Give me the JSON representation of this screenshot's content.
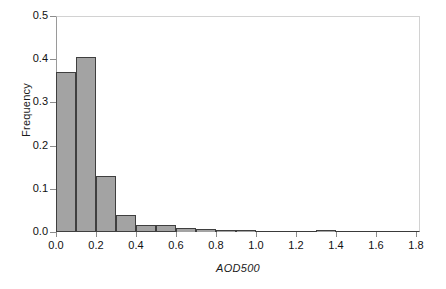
{
  "chart_data": {
    "type": "bar",
    "title": "",
    "subtitle": "",
    "xlabel": "AOD500",
    "ylabel": "Frequency",
    "xlim": [
      0.0,
      1.82
    ],
    "ylim": [
      0.0,
      0.5
    ],
    "grid": false,
    "legend": null,
    "bin_width": 0.1,
    "x_ticks": [
      "0.0",
      "0.2",
      "0.4",
      "0.6",
      "0.8",
      "1.0",
      "1.2",
      "1.4",
      "1.6",
      "1.8"
    ],
    "x_tick_values": [
      0.0,
      0.2,
      0.4,
      0.6,
      0.8,
      1.0,
      1.2,
      1.4,
      1.6,
      1.8
    ],
    "y_ticks": [
      "0.0",
      "0.1",
      "0.2",
      "0.3",
      "0.4",
      "0.5"
    ],
    "y_tick_values": [
      0.0,
      0.1,
      0.2,
      0.3,
      0.4,
      0.5
    ],
    "categories": [
      "0.0-0.1",
      "0.1-0.2",
      "0.2-0.3",
      "0.3-0.4",
      "0.4-0.5",
      "0.5-0.6",
      "0.6-0.7",
      "0.7-0.8",
      "0.8-0.9",
      "0.9-1.0",
      "1.0-1.1",
      "1.1-1.2",
      "1.2-1.3",
      "1.3-1.4",
      "1.4-1.5",
      "1.5-1.6",
      "1.6-1.7",
      "1.7-1.8"
    ],
    "bin_starts": [
      0.0,
      0.1,
      0.2,
      0.3,
      0.4,
      0.5,
      0.6,
      0.7,
      0.8,
      0.9,
      1.0,
      1.1,
      1.2,
      1.3,
      1.4,
      1.5,
      1.6,
      1.7
    ],
    "values": [
      0.37,
      0.405,
      0.13,
      0.04,
      0.016,
      0.016,
      0.009,
      0.006,
      0.004,
      0.004,
      0.0,
      0.0,
      0.0,
      0.005,
      0.0,
      0.0,
      0.0,
      0.0
    ],
    "colors": {
      "bar_fill": "#a3a3a3",
      "bar_edge": "#3f3f3f",
      "axis": "#3a3a3a",
      "frame_light": "#d2d2d2",
      "text": "#111111",
      "background": "#ffffff"
    }
  }
}
